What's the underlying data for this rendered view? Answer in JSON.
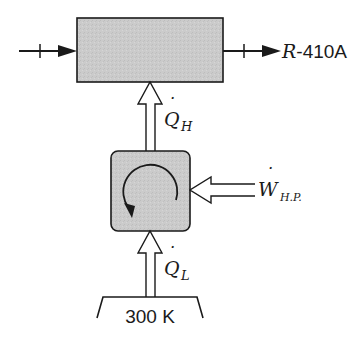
{
  "diagram": {
    "colors": {
      "stroke": "#1a1a1a",
      "box_fill": "#c9c9c9",
      "arrow_fill": "#ffffff",
      "background": "#ffffff"
    },
    "condenser": {
      "label": "",
      "refrigerant_label_prefix": "R",
      "refrigerant_label_suffix": "-410A"
    },
    "heat_pump": {
      "label": "",
      "cycle_direction": "counterclockwise"
    },
    "heat_out": {
      "symbol": "Q",
      "subscript": "H",
      "dot": "˙"
    },
    "work_in": {
      "symbol": "W",
      "subscript": "H.P.",
      "dot": "˙"
    },
    "heat_in": {
      "symbol": "Q",
      "subscript": "L",
      "dot": "˙"
    },
    "reservoir": {
      "label": "300 K"
    }
  }
}
